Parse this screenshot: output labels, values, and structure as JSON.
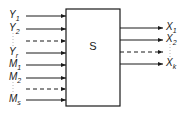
{
  "system": {
    "label": "S",
    "box": {
      "x": 66,
      "y": 9,
      "w": 54,
      "h": 97
    }
  },
  "inputs": [
    {
      "base": "Y",
      "sub": "1",
      "y": 16,
      "dashed": false
    },
    {
      "base": "Y",
      "sub": "2",
      "y": 29,
      "dashed": false
    },
    {
      "base": "",
      "sub": "",
      "y": 41,
      "dashed": true
    },
    {
      "base": "Y",
      "sub": "r",
      "y": 53,
      "dashed": false
    },
    {
      "base": "M",
      "sub": "1",
      "y": 65,
      "dashed": false
    },
    {
      "base": "M",
      "sub": "2",
      "y": 78,
      "dashed": false
    },
    {
      "base": "",
      "sub": "",
      "y": 89,
      "dashed": true
    },
    {
      "base": "M",
      "sub": "s",
      "y": 100,
      "dashed": false
    }
  ],
  "outputs": [
    {
      "base": "X",
      "sub": "1",
      "y": 28,
      "dashed": false
    },
    {
      "base": "X",
      "sub": "2",
      "y": 40,
      "dashed": false
    },
    {
      "base": "",
      "sub": "",
      "y": 52,
      "dashed": true
    },
    {
      "base": "X",
      "sub": "k",
      "y": 64,
      "dashed": false
    }
  ],
  "colors": {
    "line": "#1a1a1a",
    "background": "#ffffff"
  }
}
